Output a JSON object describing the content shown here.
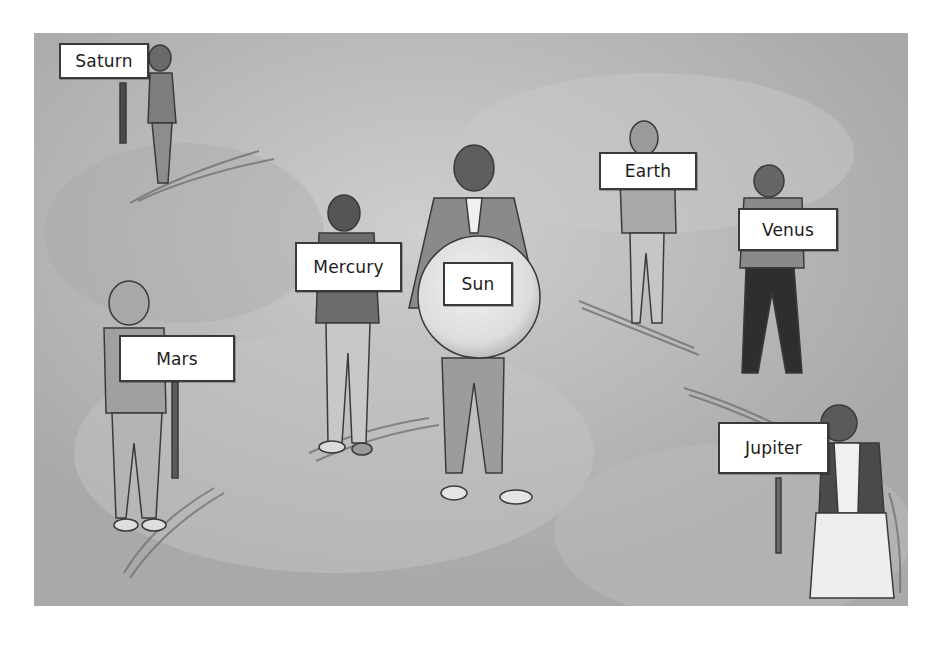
{
  "illustration": {
    "description": "Children acting out the solar system, each holding a planet sign around a boy holding a large Sun ball",
    "background_color": "#b3b3b3",
    "figures": [
      {
        "role": "sun",
        "label": "Sun"
      },
      {
        "role": "planet",
        "label": "Mercury"
      },
      {
        "role": "planet",
        "label": "Venus"
      },
      {
        "role": "planet",
        "label": "Earth"
      },
      {
        "role": "planet",
        "label": "Mars"
      },
      {
        "role": "planet",
        "label": "Jupiter"
      },
      {
        "role": "planet",
        "label": "Saturn"
      }
    ]
  },
  "signs": {
    "saturn": "Saturn",
    "mercury": "Mercury",
    "sun": "Sun",
    "earth": "Earth",
    "venus": "Venus",
    "mars": "Mars",
    "jupiter": "Jupiter"
  }
}
